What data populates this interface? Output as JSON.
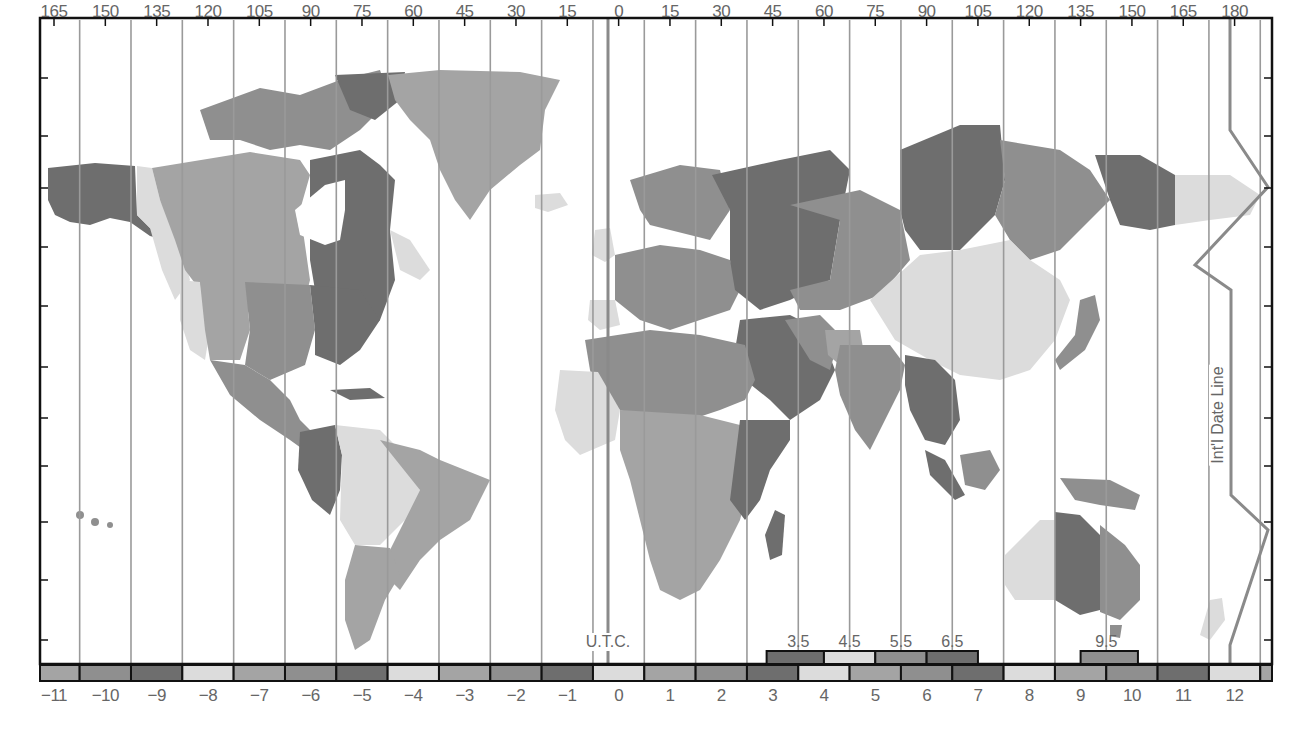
{
  "map": {
    "title": "World Time Zones",
    "top_axis_longitudes": [
      "165",
      "150",
      "135",
      "120",
      "105",
      "90",
      "75",
      "60",
      "45",
      "30",
      "15",
      "0",
      "15",
      "30",
      "45",
      "60",
      "75",
      "90",
      "105",
      "120",
      "135",
      "150",
      "165",
      "180"
    ],
    "utc_label": "U.T.C.",
    "dateline_label": "Int'l Date Line",
    "zone_offsets": [
      "−11",
      "−10",
      "−9",
      "−8",
      "−7",
      "−6",
      "−5",
      "−4",
      "−3",
      "−2",
      "−1",
      "0",
      "1",
      "2",
      "3",
      "4",
      "5",
      "6",
      "7",
      "8",
      "9",
      "10",
      "11",
      "12"
    ],
    "half_hour_offsets": [
      "3.5",
      "4.5",
      "5.5",
      "6.5",
      "9.5"
    ],
    "shades": {
      "dark": "#6e6e6e",
      "mid": "#8f8f8f",
      "light": "#a4a4a4",
      "pale": "#dcdcdc",
      "line": "#9a9a9a",
      "utc_line": "#8a8a8a",
      "frame": "#111111"
    },
    "legend_bar_shades": [
      "light",
      "mid",
      "dark",
      "pale",
      "light",
      "mid",
      "dark",
      "pale",
      "light",
      "mid",
      "dark",
      "pale",
      "light",
      "mid",
      "dark",
      "pale",
      "light",
      "mid",
      "dark",
      "pale",
      "light",
      "mid",
      "dark",
      "pale"
    ],
    "half_hour_shades": [
      "dark",
      "pale",
      "mid",
      "dark",
      "mid"
    ]
  }
}
